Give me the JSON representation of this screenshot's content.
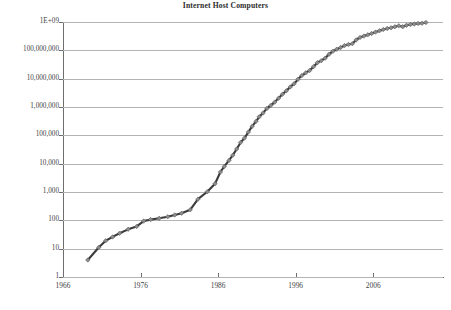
{
  "chart": {
    "title": "Internet Host Computers"
  },
  "chart_data": {
    "type": "line",
    "title": "Internet Host Computers",
    "xlabel": "",
    "ylabel": "",
    "scale": {
      "x": "linear",
      "y": "log10"
    },
    "grid": "horizontal",
    "legend": "none",
    "xlim": [
      1966,
      2015
    ],
    "ylim": [
      1,
      1000000000
    ],
    "x_tick_labels": [
      "1966",
      "1976",
      "1986",
      "1996",
      "2006"
    ],
    "x_tick_values": [
      1966,
      1976,
      1986,
      1996,
      2006
    ],
    "y_tick_labels": [
      "1",
      "10",
      "100",
      "1,000",
      "10,000",
      "100,000",
      "1,000,000",
      "10,000,000",
      "100,000,000",
      "1E+09"
    ],
    "y_tick_values": [
      1,
      10,
      100,
      1000,
      10000,
      100000,
      1000000,
      10000000,
      100000000,
      1000000000
    ],
    "series": [
      {
        "name": "Internet host computers",
        "marker": "diamond",
        "marker_color": "#8c8c8c",
        "line_color": "#3c3c3c",
        "x": [
          1969.2,
          1970.6,
          1971.5,
          1972.4,
          1973.3,
          1974.4,
          1975.5,
          1976.4,
          1977.3,
          1978.4,
          1979.5,
          1980.4,
          1981.3,
          1982.4,
          1983.4,
          1984.6,
          1985.6,
          1986.3,
          1986.8,
          1987.4,
          1987.9,
          1988.4,
          1988.9,
          1989.4,
          1989.9,
          1990.4,
          1990.9,
          1991.3,
          1991.8,
          1992.3,
          1992.8,
          1993.3,
          1993.8,
          1994.3,
          1994.8,
          1995.3,
          1995.8,
          1996.3,
          1996.8,
          1997.3,
          1997.8,
          1998.3,
          1998.8,
          1999.3,
          1999.8,
          2000.3,
          2000.8,
          2001.3,
          2001.8,
          2002.3,
          2002.8,
          2003.3,
          2003.8,
          2004.3,
          2004.8,
          2005.3,
          2005.8,
          2006.3,
          2006.8,
          2007.3,
          2007.8,
          2008.3,
          2008.8,
          2009.3,
          2009.8,
          2010.3,
          2010.8,
          2011.3,
          2011.8,
          2012.3,
          2012.8
        ],
        "y": [
          4,
          11,
          19,
          26,
          35,
          48,
          61,
          94,
          106,
          118,
          134,
          155,
          179,
          235,
          560,
          1024,
          1961,
          5089,
          8000,
          13000,
          20000,
          33000,
          56000,
          80000,
          130000,
          210000,
          313000,
          450000,
          617000,
          890000,
          1140000,
          1486000,
          2056000,
          2830000,
          3730000,
          5110000,
          6640000,
          9470000,
          12900000,
          16100000,
          19500000,
          26600000,
          36700000,
          43200000,
          53000000,
          72400000,
          93000000,
          109600000,
          125800000,
          147300000,
          162100000,
          171600000,
          233100000,
          285100000,
          317600000,
          353300000,
          394000000,
          439300000,
          489700000,
          541700000,
          589000000,
          625200000,
          681600000,
          733000000,
          681600000,
          768900000,
          818400000,
          849900000,
          888200000,
          908500000,
          960000000
        ]
      }
    ]
  }
}
